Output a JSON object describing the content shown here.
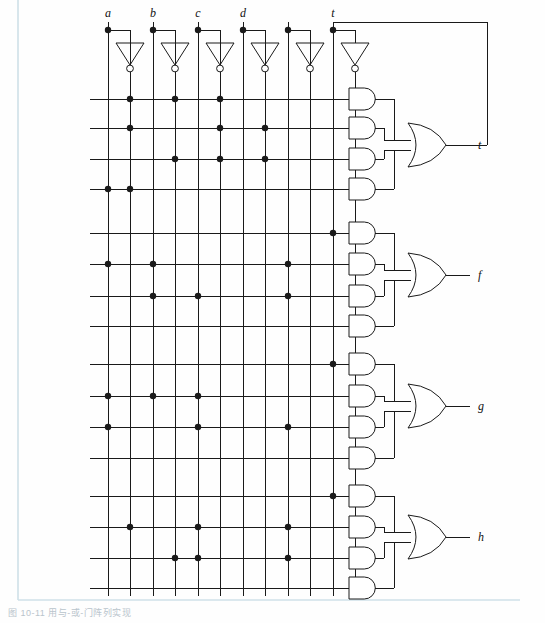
{
  "figure": {
    "type": "pla-logic-diagram",
    "caption": "图 10-11 用与-或-门阵列实现",
    "stroke_color": "#1a1a1a",
    "background_color": "#fefefe",
    "border_color": "#cfe0e8"
  },
  "inputs": [
    {
      "id": "a",
      "label": "a",
      "x": 108
    },
    {
      "id": "b",
      "label": "b",
      "x": 153
    },
    {
      "id": "c",
      "label": "c",
      "x": 198
    },
    {
      "id": "d",
      "label": "d",
      "x": 243
    },
    {
      "id": "e",
      "label": "",
      "x": 288
    },
    {
      "id": "t",
      "label": "t",
      "x": 333
    }
  ],
  "columns": [
    {
      "index": 0,
      "signal": "a",
      "polarity": "true",
      "x": 108
    },
    {
      "index": 1,
      "signal": "a",
      "polarity": "inverted",
      "x": 130
    },
    {
      "index": 2,
      "signal": "b",
      "polarity": "true",
      "x": 153
    },
    {
      "index": 3,
      "signal": "b",
      "polarity": "inverted",
      "x": 175
    },
    {
      "index": 4,
      "signal": "c",
      "polarity": "true",
      "x": 198
    },
    {
      "index": 5,
      "signal": "c",
      "polarity": "inverted",
      "x": 220
    },
    {
      "index": 6,
      "signal": "d",
      "polarity": "true",
      "x": 243
    },
    {
      "index": 7,
      "signal": "d",
      "polarity": "inverted",
      "x": 265
    },
    {
      "index": 8,
      "signal": "e",
      "polarity": "true",
      "x": 288
    },
    {
      "index": 9,
      "signal": "e",
      "polarity": "inverted",
      "x": 310
    },
    {
      "index": 10,
      "signal": "t",
      "polarity": "true",
      "x": 333
    },
    {
      "index": 11,
      "signal": "t",
      "polarity": "inverted",
      "x": 333
    }
  ],
  "inverters": [
    {
      "input": "a",
      "tap_x": 108,
      "out_x": 130
    },
    {
      "input": "b",
      "tap_x": 153,
      "out_x": 175
    },
    {
      "input": "c",
      "tap_x": 198,
      "out_x": 220
    },
    {
      "input": "d",
      "tap_x": 243,
      "out_x": 265
    },
    {
      "input": "e",
      "tap_x": 288,
      "out_x": 310
    },
    {
      "input": "t",
      "tap_x": 333,
      "out_x": 355
    }
  ],
  "outputs": [
    {
      "id": "t",
      "label": "t",
      "feedback": true,
      "or_y": 145
    },
    {
      "id": "f",
      "label": "f",
      "feedback": false,
      "or_y": 275
    },
    {
      "id": "g",
      "label": "g",
      "feedback": false,
      "or_y": 406
    },
    {
      "id": "h",
      "label": "h",
      "feedback": false,
      "or_y": 537
    }
  ],
  "and_rows": [
    {
      "row": 0,
      "output": "t",
      "y": 99,
      "dots": [
        1,
        3,
        5
      ]
    },
    {
      "row": 1,
      "output": "t",
      "y": 128,
      "dots": [
        1,
        5,
        7
      ]
    },
    {
      "row": 2,
      "output": "t",
      "y": 159,
      "dots": [
        3,
        5,
        7
      ]
    },
    {
      "row": 3,
      "output": "t",
      "y": 189,
      "dots": [
        0,
        1
      ]
    },
    {
      "row": 4,
      "output": "f",
      "y": 233,
      "dots": [
        10
      ]
    },
    {
      "row": 5,
      "output": "f",
      "y": 264,
      "dots": [
        0,
        2,
        8
      ]
    },
    {
      "row": 6,
      "output": "f",
      "y": 296,
      "dots": [
        2,
        4,
        8
      ]
    },
    {
      "row": 7,
      "output": "f",
      "y": 326,
      "dots": []
    },
    {
      "row": 8,
      "output": "g",
      "y": 364,
      "dots": [
        10
      ]
    },
    {
      "row": 9,
      "output": "g",
      "y": 396,
      "dots": [
        0,
        2,
        4
      ]
    },
    {
      "row": 10,
      "output": "g",
      "y": 427,
      "dots": [
        0,
        4,
        8
      ]
    },
    {
      "row": 11,
      "output": "g",
      "y": 458,
      "dots": []
    },
    {
      "row": 12,
      "output": "h",
      "y": 496,
      "dots": [
        10
      ]
    },
    {
      "row": 13,
      "output": "h",
      "y": 527,
      "dots": [
        1,
        4,
        8
      ]
    },
    {
      "row": 14,
      "output": "h",
      "y": 558,
      "dots": [
        3,
        4,
        8
      ]
    },
    {
      "row": 15,
      "output": "h",
      "y": 588,
      "dots": []
    }
  ],
  "geometry": {
    "grid_left": 90,
    "grid_right": 345,
    "and_gate_x": 349,
    "and_gate_w": 34,
    "and_gate_h": 22,
    "or_gate_x": 408,
    "or_gate_w": 38,
    "or_gate_h": 44,
    "output_stub_x": 470,
    "feedback_top_y": 22,
    "feedback_right_x": 487,
    "dot_radius": 3.2
  }
}
